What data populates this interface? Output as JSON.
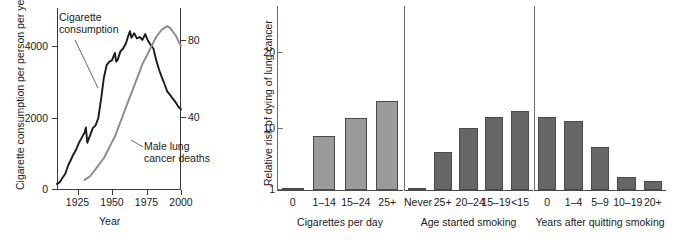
{
  "figure": {
    "caption_absent": true
  },
  "chart_data": [
    {
      "type": "line",
      "panel": "left",
      "title": "",
      "xlabel": "Year",
      "ylabel": "Cigarette consumption per person per year",
      "ylabel_right": "Age-adjusted lung cancer death rate",
      "ylabel_right_2": "(per 100,000 people)",
      "xlim": [
        1910,
        2000
      ],
      "ylim": [
        0,
        5000
      ],
      "ylim_right": [
        0,
        100
      ],
      "xticks": [
        "1925",
        "1950",
        "1975",
        "2000"
      ],
      "xtick_values": [
        1925,
        1950,
        1975,
        2000
      ],
      "yticks_left": [
        "0",
        "2000",
        "4000"
      ],
      "ytick_values_left": [
        0,
        2000,
        4000
      ],
      "yticks_right": [
        "40",
        "80"
      ],
      "ytick_values_right": [
        40,
        80
      ],
      "grid": false,
      "legend_position": "inline-annotations",
      "annotations": [
        {
          "text_line1": "Cigarette",
          "text_line2": "consumption"
        },
        {
          "text_line1": "Male lung",
          "text_line2": "cancer deaths"
        }
      ],
      "series": [
        {
          "name": "Cigarette consumption",
          "color": "#1a1a1a",
          "x": [
            1910,
            1912,
            1914,
            1916,
            1918,
            1920,
            1922,
            1924,
            1926,
            1928,
            1930,
            1931,
            1932,
            1934,
            1936,
            1938,
            1940,
            1942,
            1944,
            1946,
            1948,
            1950,
            1952,
            1953,
            1954,
            1956,
            1958,
            1960,
            1962,
            1963,
            1964,
            1966,
            1968,
            1970,
            1972,
            1974,
            1976,
            1978,
            1980,
            1982,
            1984,
            1986,
            1988,
            1990,
            1992,
            1994,
            1996,
            1998,
            2000
          ],
          "values": [
            140,
            190,
            310,
            420,
            640,
            800,
            960,
            1100,
            1280,
            1420,
            1560,
            1700,
            1280,
            1480,
            1680,
            1760,
            1960,
            2480,
            3060,
            3420,
            3520,
            3560,
            3760,
            3520,
            3560,
            3800,
            3880,
            4020,
            4260,
            4360,
            4180,
            4300,
            4160,
            4200,
            4120,
            4280,
            4100,
            3980,
            3880,
            3560,
            3300,
            3100,
            2900,
            2700,
            2600,
            2500,
            2400,
            2280,
            2200
          ]
        },
        {
          "name": "Male lung cancer deaths",
          "color": "#8a8a8a",
          "x": [
            1930,
            1932,
            1934,
            1936,
            1938,
            1940,
            1942,
            1944,
            1946,
            1948,
            1950,
            1952,
            1954,
            1956,
            1958,
            1960,
            1962,
            1964,
            1966,
            1968,
            1970,
            1972,
            1974,
            1976,
            1978,
            1980,
            1982,
            1984,
            1986,
            1988,
            1990,
            1992,
            1994,
            1996,
            1998,
            2000
          ],
          "values": [
            5,
            6,
            7,
            9,
            11,
            13,
            15,
            17,
            20,
            23,
            26,
            29,
            33,
            37,
            41,
            45,
            49,
            53,
            57,
            61,
            65,
            69,
            72,
            75,
            78,
            81,
            84,
            86,
            88,
            89,
            90,
            89,
            87,
            85,
            82,
            79
          ]
        }
      ]
    },
    {
      "type": "bar",
      "panel": "middle-left",
      "group_title": "Cigarettes per day",
      "ylabel": "Relative risk of dying of lung cancer",
      "yscale": "log",
      "yticks": [
        "1",
        "10",
        "20"
      ],
      "ytick_values": [
        1,
        10,
        20
      ],
      "ylim": [
        1,
        30
      ],
      "grid": false,
      "bar_color": "#9b9b9b",
      "categories": [
        "0",
        "1–14",
        "15–24",
        "25+"
      ],
      "values": [
        1,
        7.5,
        14.5,
        27
      ]
    },
    {
      "type": "bar",
      "panel": "middle-right",
      "group_title": "Age started smoking",
      "yscale": "log",
      "ylim": [
        1,
        30
      ],
      "grid": false,
      "bar_color": "#666666",
      "categories": [
        "Never",
        "25+",
        "20–24",
        "15–19",
        "<15"
      ],
      "values": [
        1,
        4,
        10,
        15,
        19
      ]
    },
    {
      "type": "bar",
      "panel": "right",
      "group_title": "Years after quitting smoking",
      "yscale": "log",
      "ylim": [
        1,
        30
      ],
      "grid": false,
      "bar_color": "#666666",
      "categories": [
        "0",
        "1–4",
        "5–9",
        "10–19",
        "20+"
      ],
      "values": [
        15,
        13,
        5,
        1.6,
        1.4
      ]
    }
  ],
  "left_panel": {
    "ylabel_left": "Cigarette consumption per person per year",
    "ylabel_right_line1": "Age-adjusted lung cancer death rate",
    "ylabel_right_line2": "(per 100,000 people)",
    "xlabel": "Year",
    "yticks_left": [
      "4000",
      "2000",
      "0"
    ],
    "yticks_right": [
      "80",
      "40"
    ],
    "xticks": [
      "1925",
      "1950",
      "1975",
      "2000"
    ],
    "annot_cig_line1": "Cigarette",
    "annot_cig_line2": "consumption",
    "annot_death_line1": "Male lung",
    "annot_death_line2": "cancer deaths"
  },
  "bars_panel": {
    "ylabel": "Relative risk of dying of lung cancer",
    "yticks": [
      "20",
      "10",
      "1"
    ],
    "group1_title": "Cigarettes per day",
    "group2_title": "Age started smoking",
    "group3_title": "Years after quitting smoking",
    "group1_categories": [
      "0",
      "1–14",
      "15–24",
      "25+"
    ],
    "group2_categories": [
      "Never",
      "25+",
      "20–24",
      "15–19",
      "<15"
    ],
    "group3_categories": [
      "0",
      "1–4",
      "5–9",
      "10–19",
      "20+"
    ]
  },
  "colors": {
    "cigarette_line": "#1a1a1a",
    "death_line": "#8a8a8a",
    "bars_light": "#9b9b9b",
    "bars_dark": "#666666",
    "axis": "#3a3a3a",
    "text": "#1a1a1a"
  }
}
